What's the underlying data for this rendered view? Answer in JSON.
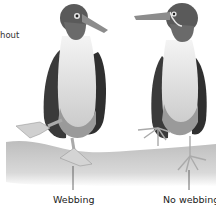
{
  "figure": {
    "partial_text_top_left": "hout",
    "labels": {
      "left": "Webbing",
      "right": "No webbing"
    },
    "colors": {
      "background": "#ffffff",
      "ground": "#c8c8c8",
      "bird_dark": "#3a3a3a",
      "bird_light": "#e8e8e8",
      "feet": "#d4d4d4",
      "text": "#222222"
    }
  }
}
